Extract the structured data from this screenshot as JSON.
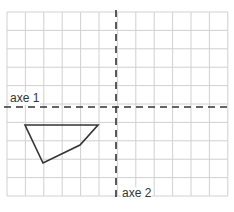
{
  "diagram": {
    "type": "grid-symmetry-exercise",
    "grid": {
      "columns": 12,
      "rows": 10,
      "line_color": "#cfcfcf"
    },
    "axes": [
      {
        "name": "axe 1",
        "orientation": "horizontal",
        "style": "dashed"
      },
      {
        "name": "axe 2",
        "orientation": "vertical",
        "style": "dashed"
      }
    ],
    "shape": {
      "type": "quadrilateral",
      "vertices": [
        [
          25,
          125
        ],
        [
          98,
          125
        ],
        [
          80,
          145
        ],
        [
          43,
          163
        ]
      ],
      "stroke": "#333333"
    }
  },
  "labels": {
    "axis1": "axe 1",
    "axis2": "axe 2"
  }
}
